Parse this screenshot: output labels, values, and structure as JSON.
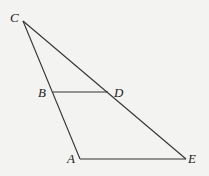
{
  "diagram": {
    "type": "geometry",
    "points": {
      "C": {
        "label": "C",
        "x": 23,
        "y": 21,
        "lx": 10,
        "ly": 22
      },
      "B": {
        "label": "B",
        "x": 53,
        "y": 92,
        "lx": 38,
        "ly": 97
      },
      "D": {
        "label": "D",
        "x": 108,
        "y": 92,
        "lx": 114,
        "ly": 97
      },
      "A": {
        "label": "A",
        "x": 80,
        "y": 159,
        "lx": 67,
        "ly": 163
      },
      "E": {
        "label": "E",
        "x": 186,
        "y": 159,
        "lx": 188,
        "ly": 163
      }
    },
    "segments": [
      [
        "C",
        "A"
      ],
      [
        "C",
        "E"
      ],
      [
        "B",
        "D"
      ],
      [
        "A",
        "E"
      ]
    ],
    "colors": {
      "background": "#f3f3f1",
      "stroke": "#333333",
      "text": "#222222"
    }
  }
}
